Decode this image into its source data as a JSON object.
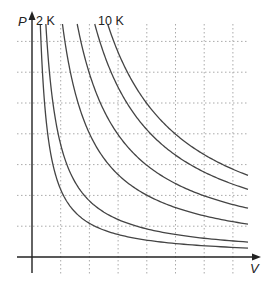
{
  "chart_data": {
    "type": "line",
    "title": "",
    "subtitle": "Isotherms (P vs V)",
    "xlabel": "V",
    "ylabel": "P",
    "grid": true,
    "legend": "none",
    "annotations": [
      {
        "text": "2 K",
        "position": "top of innermost isotherm"
      },
      {
        "text": "10 K",
        "position": "top of outermost isotherm"
      }
    ],
    "series": [
      {
        "name": "2 K",
        "k": 1935
      },
      {
        "name": "4 K",
        "k": 3225
      },
      {
        "name": "6 K",
        "k": 7095
      },
      {
        "name": "7 K",
        "k": 10535
      },
      {
        "name": "8 K",
        "k": 14620
      },
      {
        "name": "10 K",
        "k": 17630
      }
    ],
    "relationship": "P = k / V (hyperbolic isotherms)"
  },
  "figure": {
    "axis_label_p": "P",
    "axis_label_v": "V",
    "label_low": "2 K",
    "label_high": "10 K",
    "colors": {
      "axis": "#222222",
      "curve": "#444444",
      "grid": "#aaaaaa"
    }
  }
}
